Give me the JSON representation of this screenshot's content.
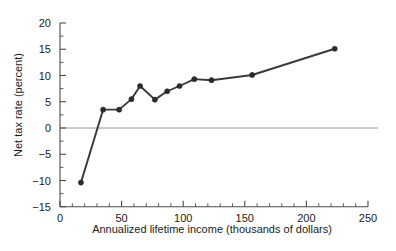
{
  "chart_data": {
    "type": "line",
    "title": "",
    "xlabel": "Annualized lifetime income (thousands of dollars)",
    "ylabel": "Net tax rate (percent)",
    "xlim": [
      0,
      250
    ],
    "ylim": [
      -15,
      20
    ],
    "x_major_ticks": [
      0,
      50,
      100,
      150,
      200,
      250
    ],
    "x_major_tick_labels": [
      "0",
      "50",
      "100",
      "150",
      "200",
      "250"
    ],
    "x_minor_tick_step": 10,
    "y_major_ticks": [
      -15,
      -10,
      -5,
      0,
      5,
      10,
      15,
      20
    ],
    "y_major_tick_labels": [
      "−15",
      "−10",
      "−5",
      "0",
      "5",
      "10",
      "15",
      "20"
    ],
    "y_minor_tick_step": 2.5,
    "grid": false,
    "legend": null,
    "zero_line": 0,
    "marker": "circle",
    "line_color": "#3a3a3a",
    "marker_color": "#2b2b2b",
    "axis_color": "#4a4a4a",
    "zero_line_color": "#8a8a8a",
    "x": [
      17,
      35,
      48,
      58,
      65,
      77,
      87,
      97,
      109,
      123,
      156,
      223
    ],
    "values": [
      -10.4,
      3.5,
      3.5,
      5.5,
      8.0,
      5.4,
      7.0,
      8.0,
      9.3,
      9.1,
      10.1,
      15.1
    ],
    "series": [
      {
        "name": "Net tax rate",
        "points": [
          {
            "x": 17,
            "y": -10.4
          },
          {
            "x": 35,
            "y": 3.5
          },
          {
            "x": 48,
            "y": 3.5
          },
          {
            "x": 58,
            "y": 5.5
          },
          {
            "x": 65,
            "y": 8.0
          },
          {
            "x": 77,
            "y": 5.4
          },
          {
            "x": 87,
            "y": 7.0
          },
          {
            "x": 97,
            "y": 8.0
          },
          {
            "x": 109,
            "y": 9.3
          },
          {
            "x": 123,
            "y": 9.1
          },
          {
            "x": 156,
            "y": 10.1
          },
          {
            "x": 223,
            "y": 15.1
          }
        ]
      }
    ]
  }
}
